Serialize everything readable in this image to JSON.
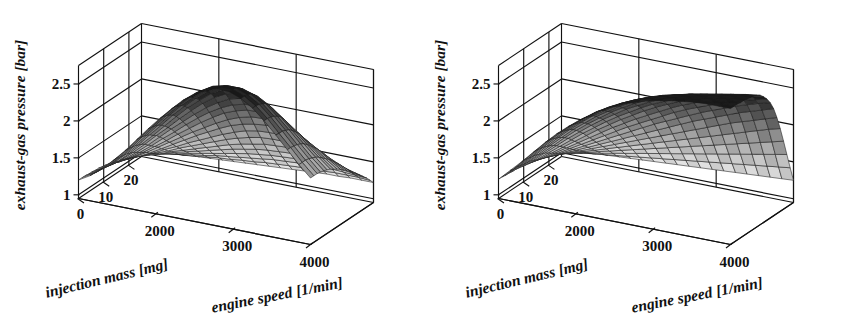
{
  "figure": {
    "background": "#ffffff",
    "ink": "#111111",
    "panel_count": 2
  },
  "chart_data": [
    {
      "type": "surface",
      "title": "",
      "xlabel": "engine speed [1/min]",
      "ylabel": "injection mass [mg]",
      "zlabel": "exhaust-gas pressure [bar]",
      "xlabel_units": "[1/min]",
      "ylabel_units": "[mg]",
      "zlabel_units": "[bar]",
      "xticks": [
        2000,
        3000,
        4000
      ],
      "xticklabels": [
        "2000",
        "3000",
        "4000"
      ],
      "yticks": [
        20,
        10,
        0
      ],
      "yticklabels": [
        "20",
        "10",
        "0"
      ],
      "zticks": [
        1,
        1.5,
        2,
        2.5
      ],
      "zticklabels": [
        "1",
        "1.5",
        "2",
        "2.5"
      ],
      "xlim": [
        1000,
        4000
      ],
      "ylim": [
        0,
        25
      ],
      "zlim": [
        0.95,
        2.75
      ],
      "grid": true,
      "legend": "none",
      "colormap": "gray",
      "mesh_nx": 20,
      "mesh_ny": 20,
      "shape": "ridge-peak",
      "description": "measured exhaust-gas pressure map, peak near 3000 1/min and 25 mg, falls off at 4000 1/min",
      "z_surface": [
        [
          1.05,
          1.06,
          1.07,
          1.08,
          1.09,
          1.1,
          1.11,
          1.12,
          1.13,
          1.14,
          1.15,
          1.16,
          1.17,
          1.18,
          1.19,
          1.2,
          1.21,
          1.21,
          1.22,
          1.22,
          1.22
        ],
        [
          1.06,
          1.08,
          1.09,
          1.11,
          1.12,
          1.14,
          1.16,
          1.18,
          1.19,
          1.21,
          1.22,
          1.24,
          1.25,
          1.26,
          1.27,
          1.28,
          1.28,
          1.29,
          1.29,
          1.29,
          1.28
        ],
        [
          1.07,
          1.09,
          1.11,
          1.14,
          1.16,
          1.19,
          1.21,
          1.24,
          1.26,
          1.28,
          1.3,
          1.32,
          1.34,
          1.35,
          1.36,
          1.36,
          1.37,
          1.37,
          1.36,
          1.35,
          1.34
        ],
        [
          1.08,
          1.11,
          1.14,
          1.17,
          1.2,
          1.24,
          1.27,
          1.3,
          1.33,
          1.36,
          1.39,
          1.41,
          1.43,
          1.44,
          1.45,
          1.45,
          1.45,
          1.44,
          1.43,
          1.41,
          1.39
        ],
        [
          1.09,
          1.12,
          1.16,
          1.2,
          1.25,
          1.29,
          1.33,
          1.37,
          1.41,
          1.45,
          1.48,
          1.51,
          1.53,
          1.54,
          1.55,
          1.55,
          1.54,
          1.52,
          1.5,
          1.47,
          1.44
        ],
        [
          1.1,
          1.14,
          1.18,
          1.23,
          1.29,
          1.34,
          1.39,
          1.44,
          1.49,
          1.54,
          1.58,
          1.61,
          1.64,
          1.65,
          1.66,
          1.65,
          1.63,
          1.61,
          1.57,
          1.53,
          1.49
        ],
        [
          1.11,
          1.15,
          1.21,
          1.27,
          1.33,
          1.4,
          1.46,
          1.52,
          1.58,
          1.64,
          1.69,
          1.73,
          1.76,
          1.77,
          1.77,
          1.76,
          1.73,
          1.69,
          1.64,
          1.59,
          1.53
        ],
        [
          1.12,
          1.17,
          1.23,
          1.3,
          1.38,
          1.45,
          1.53,
          1.6,
          1.67,
          1.74,
          1.8,
          1.85,
          1.88,
          1.89,
          1.89,
          1.87,
          1.83,
          1.78,
          1.72,
          1.65,
          1.58
        ],
        [
          1.13,
          1.18,
          1.25,
          1.33,
          1.42,
          1.51,
          1.6,
          1.69,
          1.77,
          1.85,
          1.92,
          1.97,
          2.0,
          2.02,
          2.01,
          1.98,
          1.93,
          1.86,
          1.79,
          1.7,
          1.62
        ],
        [
          1.14,
          1.2,
          1.28,
          1.37,
          1.47,
          1.57,
          1.67,
          1.77,
          1.86,
          1.95,
          2.03,
          2.09,
          2.13,
          2.14,
          2.13,
          2.09,
          2.02,
          1.94,
          1.85,
          1.75,
          1.66
        ],
        [
          1.15,
          1.21,
          1.3,
          1.4,
          1.51,
          1.62,
          1.74,
          1.85,
          1.96,
          2.06,
          2.15,
          2.21,
          2.25,
          2.26,
          2.24,
          2.19,
          2.11,
          2.01,
          1.91,
          1.8,
          1.7
        ],
        [
          1.16,
          1.23,
          1.32,
          1.43,
          1.55,
          1.68,
          1.8,
          1.93,
          2.05,
          2.16,
          2.25,
          2.32,
          2.36,
          2.37,
          2.35,
          2.29,
          2.19,
          2.08,
          1.96,
          1.84,
          1.73
        ],
        [
          1.17,
          1.24,
          1.34,
          1.46,
          1.59,
          1.73,
          1.87,
          2.0,
          2.13,
          2.25,
          2.35,
          2.43,
          2.47,
          2.48,
          2.45,
          2.38,
          2.27,
          2.15,
          2.01,
          1.88,
          1.76
        ],
        [
          1.18,
          1.25,
          1.36,
          1.49,
          1.63,
          1.78,
          1.92,
          2.07,
          2.21,
          2.34,
          2.45,
          2.53,
          2.57,
          2.58,
          2.54,
          2.46,
          2.34,
          2.2,
          2.06,
          1.92,
          1.79
        ],
        [
          1.18,
          1.26,
          1.37,
          1.51,
          1.66,
          1.81,
          1.97,
          2.13,
          2.28,
          2.41,
          2.53,
          2.61,
          2.66,
          2.66,
          2.62,
          2.53,
          2.4,
          2.25,
          2.1,
          1.95,
          1.81
        ],
        [
          1.19,
          1.27,
          1.39,
          1.53,
          1.68,
          1.85,
          2.01,
          2.18,
          2.33,
          2.47,
          2.59,
          2.68,
          2.72,
          2.72,
          2.67,
          2.58,
          2.44,
          2.29,
          2.13,
          1.97,
          1.83
        ],
        [
          1.19,
          1.28,
          1.4,
          1.54,
          1.7,
          1.87,
          2.04,
          2.21,
          2.37,
          2.51,
          2.63,
          2.72,
          2.76,
          2.76,
          2.71,
          2.61,
          2.47,
          2.31,
          2.15,
          1.99,
          1.84
        ],
        [
          1.2,
          1.28,
          1.4,
          1.55,
          1.71,
          1.89,
          2.06,
          2.23,
          2.39,
          2.54,
          2.66,
          2.75,
          2.79,
          2.79,
          2.73,
          2.63,
          2.49,
          2.33,
          2.16,
          2.0,
          1.85
        ],
        [
          1.2,
          1.29,
          1.41,
          1.56,
          1.72,
          1.9,
          2.07,
          2.25,
          2.41,
          2.55,
          2.67,
          2.76,
          2.8,
          2.8,
          2.74,
          2.64,
          2.5,
          2.33,
          2.17,
          2.0,
          1.85
        ],
        [
          1.2,
          1.29,
          1.41,
          1.56,
          1.72,
          1.9,
          2.08,
          2.25,
          2.41,
          2.56,
          2.68,
          2.77,
          2.81,
          2.8,
          2.74,
          2.64,
          2.5,
          2.34,
          2.17,
          2.0,
          1.85
        ]
      ]
    },
    {
      "type": "surface",
      "title": "",
      "xlabel": "engine speed [1/min]",
      "ylabel": "injection mass [mg]",
      "zlabel": "exhaust-gas pressure [bar]",
      "xlabel_units": "[1/min]",
      "ylabel_units": "[mg]",
      "zlabel_units": "[bar]",
      "xticks": [
        2000,
        3000,
        4000
      ],
      "xticklabels": [
        "2000",
        "3000",
        "4000"
      ],
      "yticks": [
        20,
        10,
        0
      ],
      "yticklabels": [
        "20",
        "10",
        "0"
      ],
      "zticks": [
        1,
        1.5,
        2,
        2.5
      ],
      "zticklabels": [
        "1",
        "1.5",
        "2",
        "2.5"
      ],
      "xlim": [
        1000,
        4000
      ],
      "ylim": [
        0,
        25
      ],
      "zlim": [
        0.95,
        2.75
      ],
      "grid": true,
      "legend": "none",
      "colormap": "gray",
      "mesh_nx": 20,
      "mesh_ny": 20,
      "shape": "monotonic-ramp",
      "description": "modelled exhaust-gas pressure map, rises monotonically toward high engine speed and high injection mass",
      "z_surface": [
        [
          1.05,
          1.06,
          1.07,
          1.08,
          1.09,
          1.1,
          1.11,
          1.12,
          1.13,
          1.14,
          1.15,
          1.16,
          1.17,
          1.18,
          1.19,
          1.2,
          1.21,
          1.22,
          1.23,
          1.24,
          1.25
        ],
        [
          1.06,
          1.08,
          1.09,
          1.11,
          1.13,
          1.15,
          1.17,
          1.19,
          1.21,
          1.23,
          1.25,
          1.27,
          1.29,
          1.31,
          1.33,
          1.35,
          1.37,
          1.39,
          1.41,
          1.43,
          1.45
        ],
        [
          1.07,
          1.09,
          1.12,
          1.15,
          1.18,
          1.21,
          1.24,
          1.27,
          1.3,
          1.33,
          1.36,
          1.39,
          1.42,
          1.45,
          1.48,
          1.51,
          1.54,
          1.57,
          1.6,
          1.63,
          1.66
        ],
        [
          1.08,
          1.11,
          1.15,
          1.19,
          1.23,
          1.27,
          1.31,
          1.35,
          1.39,
          1.43,
          1.47,
          1.51,
          1.55,
          1.59,
          1.63,
          1.67,
          1.71,
          1.75,
          1.79,
          1.83,
          1.87
        ],
        [
          1.09,
          1.13,
          1.18,
          1.23,
          1.28,
          1.33,
          1.38,
          1.43,
          1.48,
          1.53,
          1.58,
          1.63,
          1.68,
          1.73,
          1.78,
          1.83,
          1.88,
          1.93,
          1.98,
          2.03,
          2.07
        ],
        [
          1.1,
          1.15,
          1.21,
          1.27,
          1.33,
          1.39,
          1.45,
          1.51,
          1.57,
          1.63,
          1.69,
          1.75,
          1.81,
          1.87,
          1.93,
          1.99,
          2.05,
          2.1,
          2.15,
          2.2,
          2.25
        ],
        [
          1.11,
          1.17,
          1.24,
          1.31,
          1.38,
          1.45,
          1.52,
          1.59,
          1.66,
          1.73,
          1.8,
          1.87,
          1.94,
          2.01,
          2.07,
          2.13,
          2.19,
          2.25,
          2.3,
          2.35,
          2.4
        ],
        [
          1.12,
          1.19,
          1.27,
          1.35,
          1.43,
          1.51,
          1.59,
          1.67,
          1.75,
          1.83,
          1.91,
          1.98,
          2.05,
          2.12,
          2.19,
          2.25,
          2.31,
          2.37,
          2.42,
          2.47,
          2.51
        ],
        [
          1.13,
          1.21,
          1.3,
          1.39,
          1.48,
          1.57,
          1.66,
          1.75,
          1.84,
          1.92,
          2.0,
          2.08,
          2.16,
          2.23,
          2.29,
          2.35,
          2.41,
          2.46,
          2.51,
          2.55,
          2.59
        ],
        [
          1.14,
          1.23,
          1.33,
          1.43,
          1.53,
          1.63,
          1.73,
          1.83,
          1.92,
          2.01,
          2.09,
          2.17,
          2.25,
          2.32,
          2.38,
          2.44,
          2.49,
          2.54,
          2.58,
          2.62,
          2.65
        ],
        [
          1.15,
          1.25,
          1.36,
          1.47,
          1.58,
          1.69,
          1.8,
          1.9,
          2.0,
          2.09,
          2.18,
          2.26,
          2.33,
          2.4,
          2.46,
          2.51,
          2.56,
          2.6,
          2.64,
          2.67,
          2.7
        ],
        [
          1.16,
          1.27,
          1.39,
          1.51,
          1.63,
          1.75,
          1.86,
          1.97,
          2.07,
          2.16,
          2.25,
          2.33,
          2.4,
          2.46,
          2.52,
          2.57,
          2.61,
          2.65,
          2.68,
          2.71,
          2.73
        ],
        [
          1.17,
          1.29,
          1.42,
          1.55,
          1.68,
          1.8,
          1.92,
          2.03,
          2.13,
          2.23,
          2.31,
          2.39,
          2.46,
          2.52,
          2.57,
          2.61,
          2.65,
          2.68,
          2.71,
          2.73,
          2.75
        ],
        [
          1.18,
          1.31,
          1.44,
          1.58,
          1.72,
          1.85,
          1.97,
          2.08,
          2.19,
          2.28,
          2.37,
          2.44,
          2.51,
          2.56,
          2.61,
          2.65,
          2.68,
          2.71,
          2.73,
          2.75,
          2.76
        ],
        [
          1.19,
          1.32,
          1.46,
          1.61,
          1.75,
          1.89,
          2.01,
          2.13,
          2.23,
          2.33,
          2.41,
          2.49,
          2.55,
          2.6,
          2.64,
          2.68,
          2.71,
          2.73,
          2.75,
          2.76,
          2.77
        ],
        [
          1.19,
          1.33,
          1.48,
          1.63,
          1.78,
          1.92,
          2.05,
          2.17,
          2.27,
          2.36,
          2.45,
          2.52,
          2.58,
          2.63,
          2.67,
          2.7,
          2.73,
          2.75,
          2.76,
          2.77,
          2.78
        ],
        [
          1.2,
          1.34,
          1.49,
          1.65,
          1.8,
          1.94,
          2.07,
          2.19,
          2.3,
          2.39,
          2.47,
          2.54,
          2.6,
          2.65,
          2.69,
          2.72,
          2.74,
          2.76,
          2.77,
          2.78,
          2.78
        ],
        [
          1.2,
          1.35,
          1.5,
          1.66,
          1.82,
          1.96,
          2.09,
          2.21,
          2.32,
          2.41,
          2.49,
          2.56,
          2.62,
          2.66,
          2.7,
          2.73,
          2.75,
          2.77,
          2.78,
          2.78,
          2.79
        ],
        [
          1.21,
          1.35,
          1.51,
          1.67,
          1.83,
          1.97,
          2.1,
          2.22,
          2.33,
          2.42,
          2.5,
          2.57,
          2.63,
          2.67,
          2.71,
          2.74,
          2.76,
          2.77,
          2.78,
          2.79,
          2.79
        ],
        [
          1.21,
          1.36,
          1.51,
          1.67,
          1.83,
          1.98,
          2.11,
          2.23,
          2.33,
          2.43,
          2.51,
          2.58,
          2.63,
          2.68,
          2.71,
          2.74,
          2.76,
          2.78,
          2.79,
          2.79,
          2.79
        ]
      ]
    }
  ],
  "panels": [
    {
      "id": "left-plot",
      "name": "measured-map",
      "zlabel": "exhaust-gas pressure  [bar]",
      "ylabel": "injection mass  [mg]",
      "xlabel": "engine speed [1/min]",
      "zticklabels": [
        "2.5",
        "2",
        "1.5",
        "1"
      ],
      "yticklabels": [
        "20",
        "10",
        "0"
      ],
      "xticklabels": [
        "2000",
        "3000",
        "4000"
      ]
    },
    {
      "id": "right-plot",
      "name": "modelled-map",
      "zlabel": "exhaust-gas pressure  [bar]",
      "ylabel": "injection mass  [mg]",
      "xlabel": "engine speed [1/min]",
      "zticklabels": [
        "2.5",
        "2",
        "1.5",
        "1"
      ],
      "yticklabels": [
        "20",
        "10",
        "0"
      ],
      "xticklabels": [
        "2000",
        "3000",
        "4000"
      ]
    }
  ]
}
